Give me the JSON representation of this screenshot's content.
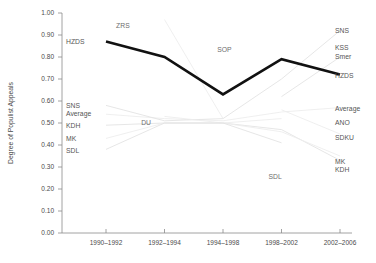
{
  "chart_data": {
    "type": "line",
    "title": "",
    "xlabel": "",
    "ylabel": "Degree of Populist Appeals",
    "ylim": [
      0.0,
      1.0
    ],
    "ytick_labels": [
      "1.00",
      "0.90",
      "0.80",
      "0.70",
      "0.60",
      "0.50",
      "0.40",
      "0.30",
      "0.20",
      "0.10",
      "0.00"
    ],
    "ytick_values": [
      1.0,
      0.9,
      0.8,
      0.7,
      0.6,
      0.5,
      0.4,
      0.3,
      0.2,
      0.1,
      0.0
    ],
    "grid": false,
    "legend_position": "inline-labels",
    "categories": [
      "1990–1992",
      "1992–1994",
      "1994–1998",
      "1998–2002",
      "2002–2006"
    ],
    "series": [
      {
        "name": "HZDS",
        "emphasis": "bold",
        "values": [
          0.87,
          0.8,
          0.63,
          0.79,
          0.72
        ]
      },
      {
        "name": "Average",
        "emphasis": "faint",
        "values": [
          0.54,
          0.52,
          0.51,
          0.55,
          0.57
        ]
      },
      {
        "name": "SNS",
        "emphasis": "faint",
        "values": [
          0.58,
          0.51,
          0.52,
          0.7,
          0.92
        ]
      },
      {
        "name": "ZRS",
        "emphasis": "faint",
        "values": [
          null,
          0.97,
          0.52,
          null,
          null
        ]
      },
      {
        "name": "SOP",
        "emphasis": "faint",
        "values": [
          null,
          null,
          null,
          0.56,
          null
        ]
      },
      {
        "name": "DU",
        "emphasis": "faint",
        "values": [
          null,
          0.53,
          0.5,
          0.52,
          null
        ]
      },
      {
        "name": "KDH",
        "emphasis": "faint",
        "values": [
          0.49,
          0.5,
          0.5,
          0.47,
          0.33
        ]
      },
      {
        "name": "MK",
        "emphasis": "faint",
        "values": [
          0.43,
          0.5,
          0.5,
          0.46,
          0.35
        ]
      },
      {
        "name": "SDL",
        "emphasis": "faint",
        "values": [
          0.38,
          0.5,
          0.5,
          0.41,
          null
        ]
      },
      {
        "name": "SDKU",
        "emphasis": "faint",
        "values": [
          null,
          null,
          null,
          0.56,
          0.45
        ]
      },
      {
        "name": "ANO",
        "emphasis": "faint",
        "values": [
          null,
          null,
          null,
          null,
          0.53
        ]
      },
      {
        "name": "KSS",
        "emphasis": "faint",
        "values": [
          null,
          null,
          null,
          null,
          0.84
        ]
      },
      {
        "name": "Smer",
        "emphasis": "faint",
        "values": [
          null,
          null,
          null,
          0.62,
          0.8
        ]
      }
    ],
    "left_labels": [
      {
        "text": "HZDS",
        "value": 0.87
      },
      {
        "text": "SNS",
        "value": 0.58
      },
      {
        "text": "Average",
        "value": 0.545
      },
      {
        "text": "KDH",
        "value": 0.49
      },
      {
        "text": "MK",
        "value": 0.43
      },
      {
        "text": "SDL",
        "value": 0.375
      }
    ],
    "right_labels": [
      {
        "text": "SNS",
        "value": 0.92
      },
      {
        "text": "KSS",
        "value": 0.845
      },
      {
        "text": "Smer",
        "value": 0.8
      },
      {
        "text": "HZDS",
        "value": 0.715
      },
      {
        "text": "Average",
        "value": 0.565
      },
      {
        "text": "ANO",
        "value": 0.5
      },
      {
        "text": "SDKU",
        "value": 0.435
      },
      {
        "text": "MK",
        "value": 0.325
      },
      {
        "text": "KDH",
        "value": 0.29
      }
    ],
    "inline_labels": [
      {
        "text": "ZRS",
        "x_frac": 0.21,
        "value": 0.945
      },
      {
        "text": "SOP",
        "x_frac": 0.56,
        "value": 0.835
      },
      {
        "text": "DU",
        "x_frac": 0.29,
        "value": 0.5
      },
      {
        "text": "SDL",
        "x_frac": 0.735,
        "value": 0.255
      }
    ]
  }
}
